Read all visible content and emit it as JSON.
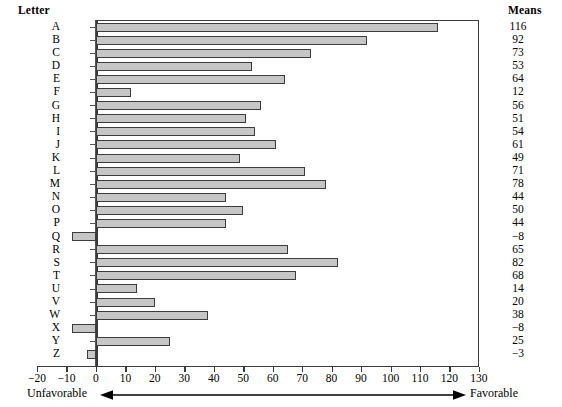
{
  "headers": {
    "letter": "Letter",
    "means": "Means"
  },
  "annotation": {
    "left_label": "Unfavorable",
    "right_label": "Favorable",
    "arrow_icon": "double-headed-arrow-icon"
  },
  "chart_data": {
    "type": "bar",
    "orientation": "horizontal",
    "title": "",
    "xlabel": "",
    "ylabel": "Letter",
    "grid": false,
    "legend": null,
    "xlim": [
      -20,
      130
    ],
    "xticks": [
      -20,
      -10,
      0,
      10,
      20,
      30,
      40,
      50,
      60,
      70,
      80,
      90,
      100,
      110,
      120,
      130
    ],
    "xtick_labels": [
      "−20",
      "−10",
      "0",
      "10",
      "20",
      "30",
      "40",
      "50",
      "60",
      "70",
      "80",
      "90",
      "100",
      "110",
      "120",
      "130"
    ],
    "categories": [
      "A",
      "B",
      "C",
      "D",
      "E",
      "F",
      "G",
      "H",
      "I",
      "J",
      "K",
      "L",
      "M",
      "N",
      "O",
      "P",
      "Q",
      "R",
      "S",
      "T",
      "U",
      "V",
      "W",
      "X",
      "Y",
      "Z"
    ],
    "values": [
      116,
      92,
      73,
      53,
      64,
      12,
      56,
      51,
      54,
      61,
      49,
      71,
      78,
      44,
      50,
      44,
      -8,
      65,
      82,
      68,
      14,
      20,
      38,
      -8,
      25,
      -3
    ],
    "value_labels": [
      "116",
      "92",
      "73",
      "53",
      "64",
      "12",
      "56",
      "51",
      "54",
      "61",
      "49",
      "71",
      "78",
      "44",
      "50",
      "44",
      "−8",
      "65",
      "82",
      "68",
      "14",
      "20",
      "38",
      "−8",
      "25",
      "−3"
    ],
    "bar_fill_color": "#c6c6c6",
    "bar_edge_color": "#3c3c3c",
    "axis_color": "#3a3a3a"
  }
}
